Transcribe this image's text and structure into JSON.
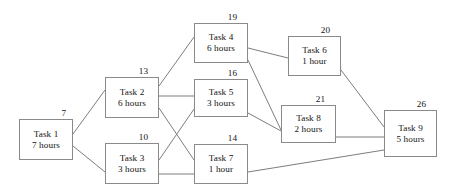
{
  "diagram": {
    "type": "activity-on-node network",
    "canvas": {
      "width": 453,
      "height": 195
    },
    "style": {
      "box_border_color": "#8a8a8a",
      "edge_color": "#7d7d7d",
      "text_color": "#141414",
      "background": "#ffffff"
    },
    "nodes": [
      {
        "id": "task-1",
        "name": "Task 1",
        "duration": "7 hours",
        "value": "7",
        "box": {
          "x": 19,
          "y": 119,
          "w": 54,
          "h": 41
        },
        "value_pos": {
          "x": 54,
          "y": 108
        }
      },
      {
        "id": "task-2",
        "name": "Task 2",
        "duration": "6 hours",
        "value": "13",
        "box": {
          "x": 105,
          "y": 77,
          "w": 54,
          "h": 41
        },
        "value_pos": {
          "x": 136,
          "y": 66
        }
      },
      {
        "id": "task-3",
        "name": "Task 3",
        "duration": "3 hours",
        "value": "10",
        "box": {
          "x": 105,
          "y": 143,
          "w": 54,
          "h": 41
        },
        "value_pos": {
          "x": 136,
          "y": 132
        }
      },
      {
        "id": "task-4",
        "name": "Task 4",
        "duration": "6 hours",
        "value": "19",
        "box": {
          "x": 194,
          "y": 23,
          "w": 54,
          "h": 40
        },
        "value_pos": {
          "x": 225,
          "y": 12
        }
      },
      {
        "id": "task-5",
        "name": "Task 5",
        "duration": "3 hours",
        "value": "16",
        "box": {
          "x": 194,
          "y": 79,
          "w": 54,
          "h": 38
        },
        "value_pos": {
          "x": 225,
          "y": 68
        }
      },
      {
        "id": "task-6",
        "name": "Task 6",
        "duration": "1 hour",
        "value": "20",
        "box": {
          "x": 288,
          "y": 36,
          "w": 53,
          "h": 40
        },
        "value_pos": {
          "x": 318,
          "y": 25
        }
      },
      {
        "id": "task-7",
        "name": "Task 7",
        "duration": "1 hour",
        "value": "14",
        "box": {
          "x": 194,
          "y": 144,
          "w": 54,
          "h": 40
        },
        "value_pos": {
          "x": 225,
          "y": 133
        }
      },
      {
        "id": "task-8",
        "name": "Task 8",
        "duration": "2 hours",
        "value": "21",
        "box": {
          "x": 281,
          "y": 105,
          "w": 55,
          "h": 38
        },
        "value_pos": {
          "x": 313,
          "y": 94
        }
      },
      {
        "id": "task-9",
        "name": "Task 9",
        "duration": "5 hours",
        "value": "26",
        "box": {
          "x": 384,
          "y": 110,
          "w": 53,
          "h": 47
        },
        "value_pos": {
          "x": 414,
          "y": 99
        }
      }
    ],
    "edges": [
      {
        "from": "task-1",
        "to": "task-2",
        "x1": 73,
        "y1": 134,
        "x2": 105,
        "y2": 90
      },
      {
        "from": "task-1",
        "to": "task-3",
        "x1": 73,
        "y1": 146,
        "x2": 105,
        "y2": 172
      },
      {
        "from": "task-2",
        "to": "task-4",
        "x1": 159,
        "y1": 86,
        "x2": 194,
        "y2": 37
      },
      {
        "from": "task-2",
        "to": "task-5",
        "x1": 159,
        "y1": 96,
        "x2": 194,
        "y2": 96
      },
      {
        "from": "task-2",
        "to": "task-7",
        "x1": 159,
        "y1": 108,
        "x2": 194,
        "y2": 160
      },
      {
        "from": "task-3",
        "to": "task-5",
        "x1": 159,
        "y1": 160,
        "x2": 194,
        "y2": 109
      },
      {
        "from": "task-3",
        "to": "task-7",
        "x1": 159,
        "y1": 174,
        "x2": 194,
        "y2": 174
      },
      {
        "from": "task-4",
        "to": "task-6",
        "x1": 248,
        "y1": 48,
        "x2": 288,
        "y2": 58
      },
      {
        "from": "task-4",
        "to": "task-8",
        "x1": 248,
        "y1": 60,
        "x2": 281,
        "y2": 130
      },
      {
        "from": "task-5",
        "to": "task-8",
        "x1": 248,
        "y1": 113,
        "x2": 281,
        "y2": 131
      },
      {
        "from": "task-6",
        "to": "task-9",
        "x1": 341,
        "y1": 70,
        "x2": 384,
        "y2": 127
      },
      {
        "from": "task-8",
        "to": "task-9",
        "x1": 336,
        "y1": 137,
        "x2": 384,
        "y2": 137
      },
      {
        "from": "task-7",
        "to": "task-9",
        "x1": 248,
        "y1": 172,
        "x2": 384,
        "y2": 150
      }
    ]
  }
}
